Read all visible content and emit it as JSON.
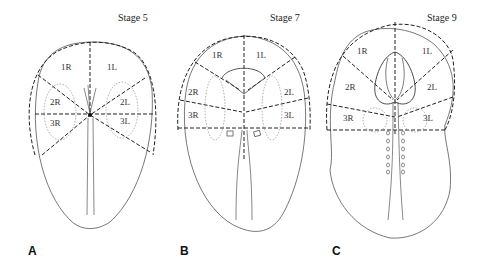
{
  "figure": {
    "panels": [
      {
        "letter": "A",
        "stage": "Stage 5",
        "regions": [
          "1R",
          "1L",
          "2R",
          "2L",
          "3R",
          "3L"
        ]
      },
      {
        "letter": "B",
        "stage": "Stage 7",
        "regions": [
          "1R",
          "1L",
          "2R",
          "2L",
          "3R",
          "3L"
        ]
      },
      {
        "letter": "C",
        "stage": "Stage 9",
        "regions": [
          "1R",
          "1L",
          "2R",
          "2L",
          "3R",
          "3L"
        ]
      }
    ],
    "colors": {
      "line": "#444444",
      "dashed": "#222222",
      "dotted": "#888888"
    }
  }
}
